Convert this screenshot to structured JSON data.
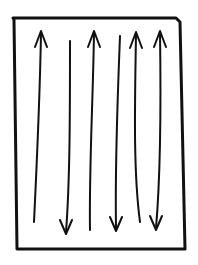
{
  "diagram": {
    "stroke_color": "#111111",
    "background_color": "#ffffff",
    "frame": {
      "points": [
        [
          13,
          18
        ],
        [
          176,
          18
        ],
        [
          180,
          22
        ],
        [
          185,
          249
        ],
        [
          17,
          249
        ],
        [
          14,
          20
        ]
      ],
      "stroke_width": 3
    },
    "lines": [
      {
        "id": 1,
        "path": "M41 33 C40 90 37 160 34 222",
        "head_top": true,
        "head_bottom": false,
        "direction": "up"
      },
      {
        "id": 2,
        "path": "M70 41 C70 110 70 180 66 232",
        "head_top": false,
        "head_bottom": true,
        "direction": "down"
      },
      {
        "id": 3,
        "path": "M94 33 C93 100 89 170 90 230",
        "head_top": true,
        "head_bottom": false,
        "direction": "up"
      },
      {
        "id": 4,
        "path": "M120 36 C117 110 115 170 116 229",
        "head_top": false,
        "head_bottom": true,
        "direction": "down"
      },
      {
        "id": 5,
        "path": "M136 34 C135 100 133 170 140 222",
        "head_top": true,
        "head_bottom": false,
        "direction": "up"
      },
      {
        "id": 6,
        "path": "M160 33 C161 100 161 170 156 228",
        "head_top": true,
        "head_bottom": true,
        "direction": "both"
      }
    ]
  }
}
